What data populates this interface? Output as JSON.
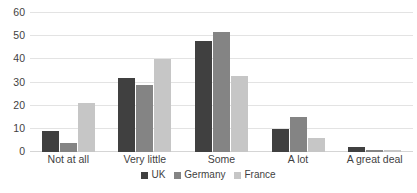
{
  "chart_data": {
    "type": "bar",
    "title": "",
    "subtitle": "",
    "xlabel": "",
    "ylabel": "",
    "categories": [
      "Not at all",
      "Very little",
      "Some",
      "A lot",
      "A great deal"
    ],
    "series": [
      {
        "name": "UK",
        "color": "#404040",
        "values": [
          9,
          32,
          48,
          10,
          2
        ]
      },
      {
        "name": "Germany",
        "color": "#848484",
        "values": [
          4,
          29,
          52,
          15,
          1
        ]
      },
      {
        "name": "France",
        "color": "#c6c6c6",
        "values": [
          21,
          40,
          33,
          6,
          1
        ]
      }
    ],
    "ylim": [
      0,
      60
    ],
    "yticks": [
      0,
      10,
      20,
      30,
      40,
      50,
      60
    ],
    "ytick_labels": [
      "0",
      "10",
      "20",
      "30",
      "40",
      "50",
      "60"
    ],
    "grid": true,
    "grid_axis": "y",
    "legend_position": "bottom",
    "bar_orientation": "vertical",
    "grouping": "grouped"
  },
  "axes": {
    "y_tick_labels": [
      "60",
      "50",
      "40",
      "30",
      "20",
      "10",
      "0"
    ]
  },
  "legend": {
    "entries": [
      {
        "label": "UK"
      },
      {
        "label": "Germany"
      },
      {
        "label": "France"
      }
    ]
  },
  "footer": {
    "caption_cut_off": ""
  }
}
